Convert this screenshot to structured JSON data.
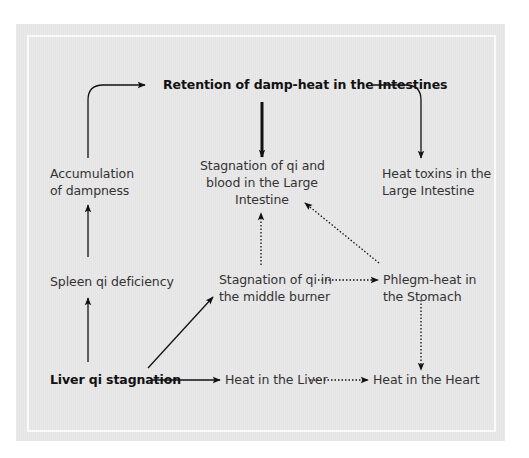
{
  "diagram": {
    "background_color": "#e6e6e6",
    "frame_color": "#fafafa",
    "text_color": "#333333",
    "nodes": {
      "retention": {
        "label": "Retention of damp-heat in the Intestines",
        "bold": true
      },
      "accumulation": {
        "line1": "Accumulation",
        "line2": "of dampness"
      },
      "stagnation_large": {
        "line1": "Stagnation of qi and",
        "line2": "blood in the Large",
        "line3": "Intestine"
      },
      "heat_toxins": {
        "line1": "Heat toxins in the",
        "line2": "Large Intestine"
      },
      "spleen": {
        "label": "Spleen qi deficiency"
      },
      "middle_burner": {
        "line1": "Stagnation of qi in",
        "line2": "the middle burner"
      },
      "phlegm": {
        "line1": "Phlegm-heat in",
        "line2": "the Stomach"
      },
      "liver_stagnation": {
        "label": "Liver qi stagnation",
        "bold": true
      },
      "heat_liver": {
        "label": "Heat in the Liver"
      },
      "heat_heart": {
        "label": "Heat in the Heart"
      }
    },
    "edges": [
      {
        "from": "liver_stagnation",
        "to": "spleen",
        "style": "solid"
      },
      {
        "from": "spleen",
        "to": "accumulation",
        "style": "solid"
      },
      {
        "from": "accumulation",
        "to": "retention",
        "style": "solid-curved"
      },
      {
        "from": "retention",
        "to": "stagnation_large",
        "style": "thick"
      },
      {
        "from": "retention",
        "to": "heat_toxins",
        "style": "solid-curved"
      },
      {
        "from": "middle_burner",
        "to": "stagnation_large",
        "style": "dotted"
      },
      {
        "from": "phlegm",
        "to": "stagnation_large",
        "style": "dotted"
      },
      {
        "from": "middle_burner",
        "to": "phlegm",
        "style": "dotted"
      },
      {
        "from": "phlegm",
        "to": "heat_heart",
        "style": "dotted"
      },
      {
        "from": "liver_stagnation",
        "to": "middle_burner",
        "style": "solid"
      },
      {
        "from": "liver_stagnation",
        "to": "heat_liver",
        "style": "solid"
      },
      {
        "from": "heat_liver",
        "to": "heat_heart",
        "style": "dotted"
      }
    ]
  }
}
